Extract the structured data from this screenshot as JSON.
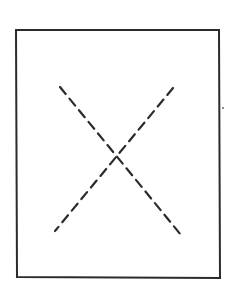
{
  "diagram": {
    "colors": {
      "stroke": "#2b2b2b",
      "background": "#ffffff"
    },
    "frame": {
      "x1": 16,
      "y1": 30,
      "x2": 219,
      "y2": 30,
      "x3": 220,
      "y3": 278,
      "x4": 17,
      "y4": 277
    },
    "lines": [
      {
        "name": "diagonal-descending",
        "x1": 60,
        "y1": 87,
        "x2": 181,
        "y2": 235,
        "style": "dashed"
      },
      {
        "name": "diagonal-ascending",
        "x1": 173,
        "y1": 88,
        "x2": 55,
        "y2": 231,
        "style": "dash-dot"
      }
    ],
    "marks": [
      {
        "name": "stray-dot",
        "x": 223,
        "y": 108
      }
    ]
  }
}
